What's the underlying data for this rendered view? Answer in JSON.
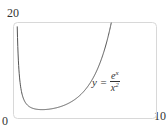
{
  "chart_data": {
    "type": "line",
    "title": "",
    "xlabel": "",
    "ylabel": "",
    "xlim": [
      0,
      10
    ],
    "ylim": [
      0,
      20
    ],
    "grid": false,
    "tick_labels": {
      "x_min": "0",
      "x_max": "10",
      "y_max": "20"
    },
    "series": [
      {
        "name": "y = e^x / x^2",
        "function": "exp(x)/x^2",
        "x": [
          0.25,
          0.3,
          0.4,
          0.5,
          0.75,
          1,
          1.5,
          2,
          2.5,
          3,
          3.5,
          4,
          4.5,
          5,
          5.5,
          6,
          6.5,
          6.8
        ],
        "y": [
          20.5,
          15.0,
          9.3,
          6.6,
          3.7,
          2.72,
          1.99,
          1.85,
          1.95,
          2.23,
          2.71,
          3.41,
          4.45,
          5.94,
          8.09,
          11.21,
          15.74,
          19.4
        ]
      }
    ],
    "annotations": [
      {
        "text_parts": {
          "lhs": "y =",
          "numerator": "e",
          "numerator_sup": "x",
          "denominator": "x",
          "denominator_sup": "2"
        },
        "position": "right-middle"
      }
    ]
  }
}
